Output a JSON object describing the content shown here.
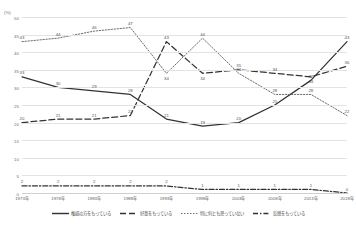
{
  "chart_data": {
    "type": "line",
    "title": "",
    "xlabel": "",
    "ylabel": "(%)",
    "unit_label": "(%)",
    "ylim": [
      0,
      50
    ],
    "yticks": [
      0,
      5,
      10,
      15,
      20,
      25,
      30,
      35,
      40,
      45,
      50
    ],
    "grid": true,
    "legend_position": "bottom",
    "categories": [
      "1973年",
      "1978年",
      "1983年",
      "1988年",
      "1993年",
      "1998年",
      "2003年",
      "2008年",
      "2013年",
      "2018年"
    ],
    "series": [
      {
        "name": "権威の方をもっている",
        "style": "solid",
        "color": "#333333",
        "values": [
          33,
          30,
          29,
          28,
          21,
          19,
          20,
          25,
          32,
          43
        ]
      },
      {
        "name": "好意をもっている",
        "style": "dashed",
        "color": "#333333",
        "values": [
          20,
          21,
          21,
          22,
          43,
          34,
          35,
          34,
          33,
          36
        ]
      },
      {
        "name": "特に何とも思っていない",
        "style": "dotted",
        "color": "#6d6d6d",
        "values": [
          43,
          44,
          46,
          47,
          34,
          44,
          34,
          28,
          28,
          22
        ]
      },
      {
        "name": "反感をもっている",
        "style": "dashdot",
        "color": "#333333",
        "values": [
          2,
          2,
          2,
          2,
          2,
          1,
          1,
          1,
          1,
          0
        ]
      }
    ]
  }
}
